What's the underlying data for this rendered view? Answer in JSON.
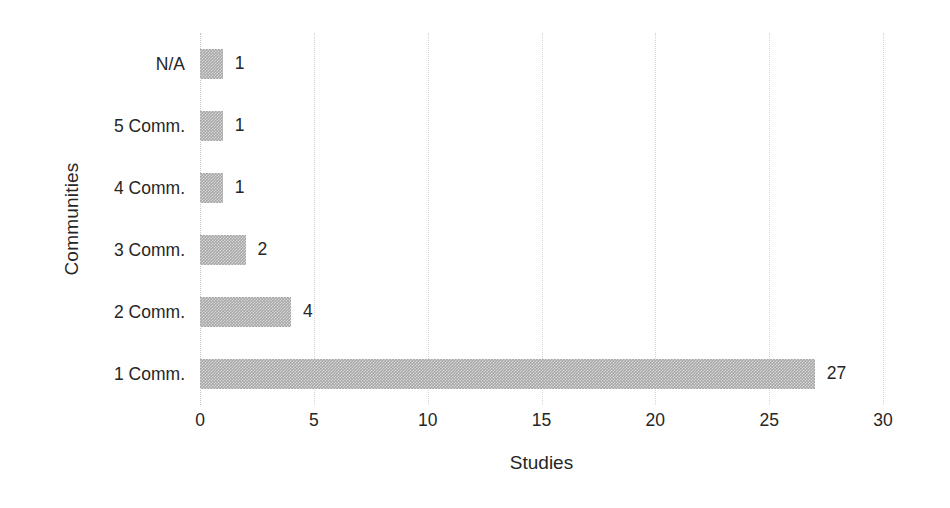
{
  "chart_data": {
    "type": "bar",
    "orientation": "horizontal",
    "title": "",
    "xlabel": "Studies",
    "ylabel": "Communities",
    "categories": [
      "1 Comm.",
      "2 Comm.",
      "3 Comm.",
      "4 Comm.",
      "5 Comm.",
      "N/A"
    ],
    "values": [
      27,
      4,
      2,
      1,
      1,
      1
    ],
    "data_labels": [
      "27",
      "4",
      "2",
      "1",
      "1",
      "1"
    ],
    "xlim": [
      0,
      30
    ],
    "xticks": [
      0,
      5,
      10,
      15,
      20,
      25,
      30
    ],
    "xtick_labels": [
      "0",
      "5",
      "10",
      "15",
      "20",
      "25",
      "30"
    ],
    "grid": "vertical-dotted",
    "legend": "none",
    "bar_color": "#a6a6a6",
    "text_color": "#262626",
    "gridline_color": "#d4d4d4",
    "background_color": "#ffffff"
  },
  "axis": {
    "x_title": "Studies",
    "y_title": "Communities"
  }
}
